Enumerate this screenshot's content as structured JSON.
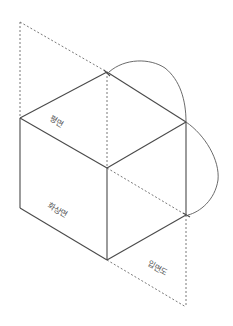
{
  "diagram": {
    "type": "orthographic-projection-cube",
    "labels": {
      "plan": "평면",
      "front_elevation": "화상면",
      "side_elevation": "입면도"
    },
    "colors": {
      "line": "#4a4a4a",
      "dashed": "#6a6a6a",
      "background": "#ffffff"
    }
  }
}
